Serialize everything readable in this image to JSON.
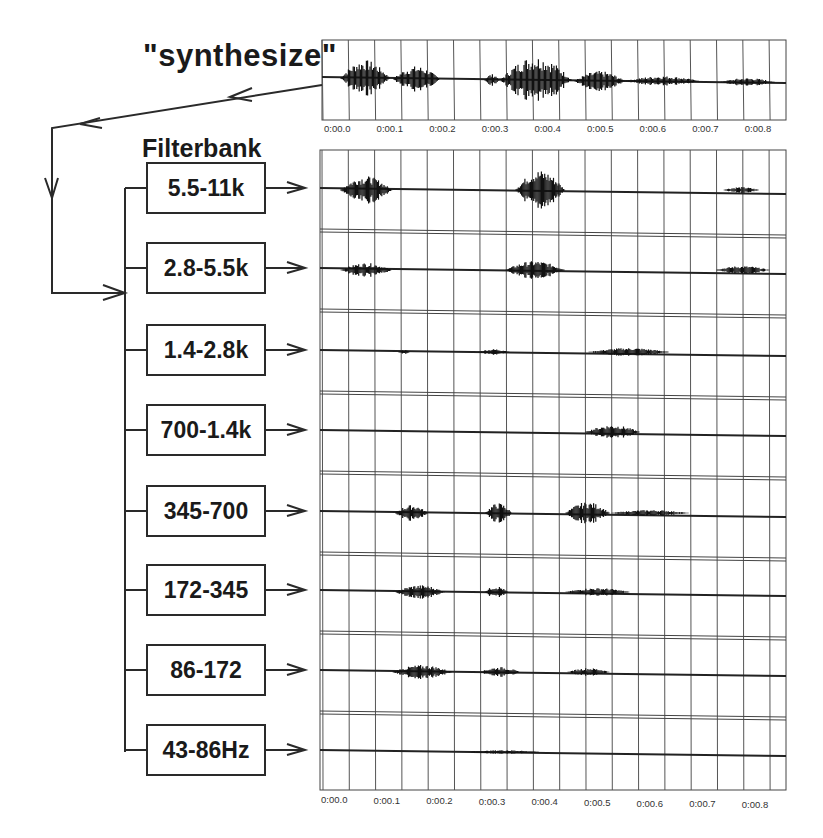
{
  "diagram": {
    "input_label": "\"synthesize\"",
    "filterbank_label": "Filterbank",
    "bands": [
      {
        "label": "5.5-11k"
      },
      {
        "label": "2.8-5.5k"
      },
      {
        "label": "1.4-2.8k"
      },
      {
        "label": "700-1.4k"
      },
      {
        "label": "345-700"
      },
      {
        "label": "172-345"
      },
      {
        "label": "86-172"
      },
      {
        "label": "43-86Hz"
      }
    ],
    "time_axis_ticks": [
      "0:00.0",
      "0:00.1",
      "0:00.2",
      "0:00.3",
      "0:00.4",
      "0:00.5",
      "0:00.6",
      "0:00.7",
      "0:00.8"
    ],
    "colors": {
      "line": "#2a2a2a",
      "grid": "#555555",
      "background": "#ffffff"
    }
  }
}
